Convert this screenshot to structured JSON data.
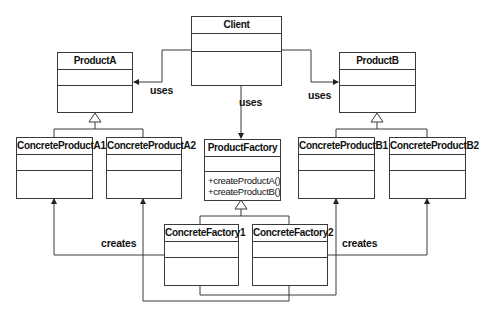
{
  "diagram": {
    "type": "UML class diagram",
    "classes": {
      "client": {
        "name": "Client"
      },
      "product_a": {
        "name": "ProductA"
      },
      "product_b": {
        "name": "ProductB"
      },
      "concrete_product_a1": {
        "name": "ConcreteProductA1"
      },
      "concrete_product_a2": {
        "name": "ConcreteProductA2"
      },
      "concrete_product_b1": {
        "name": "ConcreteProductB1"
      },
      "concrete_product_b2": {
        "name": "ConcreteProductB2"
      },
      "product_factory": {
        "name": "ProductFactory",
        "operations": [
          "+createProductA()",
          "+createProductB()"
        ]
      },
      "concrete_factory1": {
        "name": "ConcreteFactory1"
      },
      "concrete_factory2": {
        "name": "ConcreteFactory2"
      }
    },
    "labels": {
      "uses_left": "uses",
      "uses_center": "uses",
      "uses_right": "uses",
      "creates_left": "creates",
      "creates_right": "creates"
    },
    "relationships": [
      {
        "from": "Client",
        "to": "ProductA",
        "label": "uses",
        "kind": "association"
      },
      {
        "from": "Client",
        "to": "ProductFactory",
        "label": "uses",
        "kind": "association"
      },
      {
        "from": "Client",
        "to": "ProductB",
        "label": "uses",
        "kind": "association"
      },
      {
        "from": "ConcreteProductA1",
        "to": "ProductA",
        "kind": "generalization"
      },
      {
        "from": "ConcreteProductA2",
        "to": "ProductA",
        "kind": "generalization"
      },
      {
        "from": "ConcreteProductB1",
        "to": "ProductB",
        "kind": "generalization"
      },
      {
        "from": "ConcreteProductB2",
        "to": "ProductB",
        "kind": "generalization"
      },
      {
        "from": "ConcreteFactory1",
        "to": "ProductFactory",
        "kind": "generalization"
      },
      {
        "from": "ConcreteFactory2",
        "to": "ProductFactory",
        "kind": "generalization"
      },
      {
        "from": "ConcreteFactory1",
        "to": "ConcreteProductA1",
        "label": "creates",
        "kind": "association"
      },
      {
        "from": "ConcreteFactory1",
        "to": "ConcreteProductB1",
        "kind": "association"
      },
      {
        "from": "ConcreteFactory2",
        "to": "ConcreteProductA2",
        "kind": "association"
      },
      {
        "from": "ConcreteFactory2",
        "to": "ConcreteProductB2",
        "label": "creates",
        "kind": "association"
      }
    ]
  }
}
